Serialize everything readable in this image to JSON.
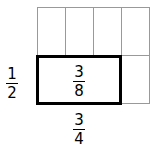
{
  "grid": {
    "columns": 4,
    "rows": 2
  },
  "labels": {
    "row_fraction": {
      "num": "1",
      "den": "2"
    },
    "inner_fraction": {
      "num": "3",
      "den": "8"
    },
    "column_fraction": {
      "num": "3",
      "den": "4"
    }
  }
}
